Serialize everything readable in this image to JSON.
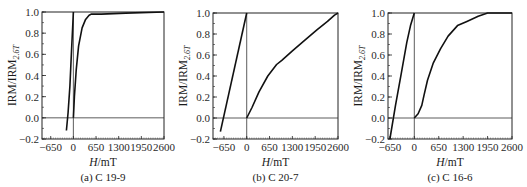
{
  "chart_data": [
    {
      "type": "line",
      "id": "a",
      "caption": "(a) C 19-9",
      "xlabel": "H/mT",
      "ylabel": "IRM/IRM2.6T",
      "xlim": [
        -900,
        2600
      ],
      "ylim": [
        -0.2,
        1.0
      ],
      "xticks": [
        -650,
        0,
        650,
        1300,
        1950,
        2600
      ],
      "yticks": [
        -0.2,
        0.0,
        0.2,
        0.4,
        0.6,
        0.8,
        1.0
      ],
      "grid": false,
      "reference_lines": {
        "h0": 0,
        "y0": 0.0
      },
      "series": [
        {
          "name": "acquisition",
          "x": [
            0,
            30,
            80,
            150,
            250,
            350,
            450,
            520,
            800,
            1500,
            2600
          ],
          "y": [
            0.0,
            0.2,
            0.45,
            0.68,
            0.85,
            0.93,
            0.97,
            0.98,
            0.98,
            0.99,
            1.0
          ]
        },
        {
          "name": "backfield",
          "x": [
            -200,
            -150,
            -100,
            -50,
            0
          ],
          "y": [
            -0.12,
            0.05,
            0.3,
            0.65,
            1.0
          ]
        }
      ]
    },
    {
      "type": "line",
      "id": "b",
      "caption": "(b) C 20-7",
      "xlabel": "H/mT",
      "ylabel": "IRM/IRM2.6T",
      "xlim": [
        -960,
        2600
      ],
      "ylim": [
        -0.2,
        1.0
      ],
      "xticks": [
        -650,
        0,
        650,
        1300,
        1950,
        2600
      ],
      "yticks": [
        -0.2,
        0.0,
        0.2,
        0.4,
        0.6,
        0.8,
        1.0
      ],
      "grid": false,
      "reference_lines": {
        "h0": 0,
        "y0": 0.0
      },
      "series": [
        {
          "name": "acquisition",
          "x": [
            0,
            150,
            350,
            600,
            850,
            1000,
            1300,
            1650,
            2000,
            2300,
            2500,
            2600
          ],
          "y": [
            0.0,
            0.1,
            0.25,
            0.4,
            0.51,
            0.55,
            0.64,
            0.74,
            0.84,
            0.92,
            0.98,
            1.0
          ]
        },
        {
          "name": "backfield",
          "x": [
            -750,
            0
          ],
          "y": [
            -0.13,
            1.0
          ]
        }
      ]
    },
    {
      "type": "line",
      "id": "c",
      "caption": "(c) C 16-6",
      "xlabel": "H/mT",
      "ylabel": "IRM/IRM2.6T",
      "xlim": [
        -700,
        2600
      ],
      "ylim": [
        -0.2,
        1.0
      ],
      "xticks": [
        -650,
        0,
        650,
        1300,
        1950,
        2600
      ],
      "yticks": [
        -0.2,
        0.0,
        0.2,
        0.4,
        0.6,
        0.8,
        1.0
      ],
      "grid": false,
      "reference_lines": {
        "h0": 0,
        "y0": 0.0
      },
      "series": [
        {
          "name": "acquisition",
          "x": [
            0,
            100,
            200,
            260,
            350,
            500,
            700,
            900,
            1150,
            1400,
            1700,
            1950,
            2600
          ],
          "y": [
            0.0,
            0.04,
            0.12,
            0.22,
            0.36,
            0.52,
            0.66,
            0.78,
            0.88,
            0.92,
            0.97,
            1.0,
            1.0
          ]
        },
        {
          "name": "backfield",
          "x": [
            -650,
            -500,
            -350,
            -200,
            -100,
            0
          ],
          "y": [
            -0.2,
            0.12,
            0.42,
            0.72,
            0.88,
            1.0
          ]
        }
      ]
    }
  ],
  "labels": {
    "xlabel_italic": "H",
    "xlabel_unit": "/mT",
    "ylabel_main": "IRM/IRM",
    "ylabel_sub": "2.6T"
  }
}
